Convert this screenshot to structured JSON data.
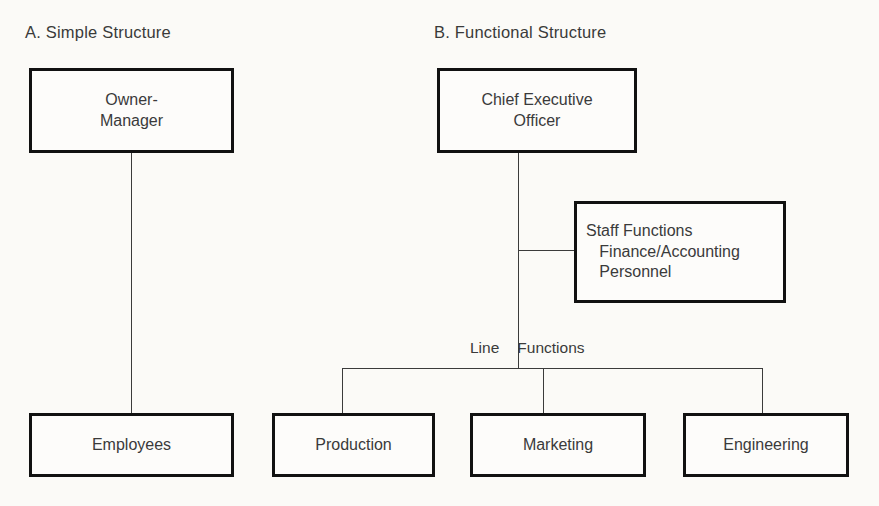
{
  "panels": [
    {
      "heading": "A. Simple Structure",
      "nodes": [
        {
          "name": "owner-manager",
          "label": "Owner-\nManager"
        },
        {
          "name": "employees",
          "label": "Employees"
        }
      ]
    },
    {
      "heading": "B. Functional Structure",
      "nodes": [
        {
          "name": "chief-executive-officer",
          "label": "Chief Executive\nOfficer"
        },
        {
          "name": "staff-functions",
          "label": "Staff Functions\n   Finance/Accounting\n   Personnel"
        },
        {
          "name": "production",
          "label": "Production"
        },
        {
          "name": "marketing",
          "label": "Marketing"
        },
        {
          "name": "engineering",
          "label": "Engineering"
        }
      ],
      "connector_label": {
        "full": "Line Functions",
        "left": "Line",
        "right": "Functions"
      }
    }
  ],
  "colors": {
    "background": "#fbfaf7",
    "box_fill": "#fdfcfa",
    "box_border": "#111111",
    "connector": "#3b3b3b",
    "text": "#3a3a3a"
  }
}
